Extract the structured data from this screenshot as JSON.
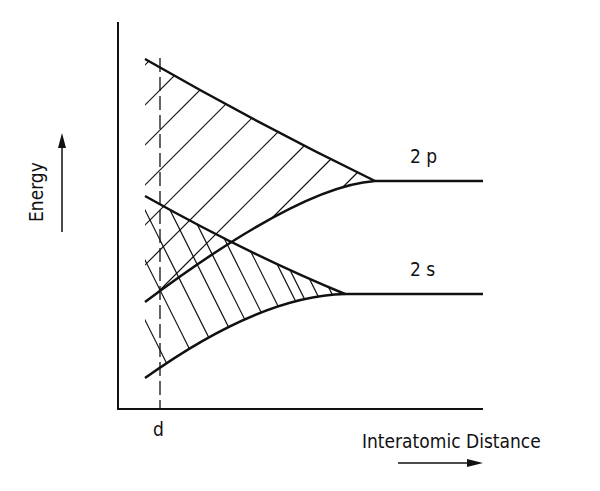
{
  "diagram": {
    "y_axis_label": "Energy",
    "x_axis_label": "Interatomic Distance",
    "marker_label": "d",
    "levels": [
      {
        "label": "2 p",
        "y": 181
      },
      {
        "label": "2 s",
        "y": 294
      }
    ],
    "colors": {
      "ink": "#111111",
      "background": "#ffffff"
    }
  }
}
